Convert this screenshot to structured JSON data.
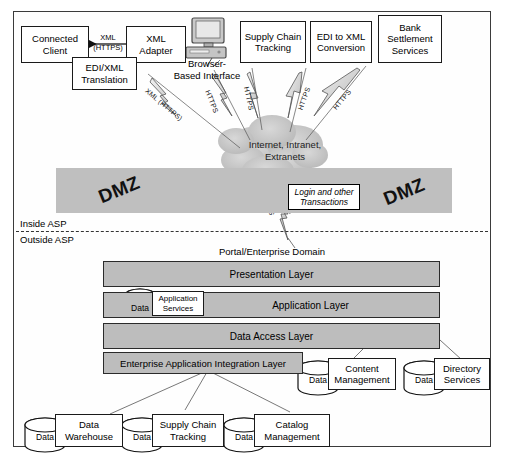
{
  "diagram": {
    "cloud": {
      "label": "Internet, Intranet,\nExtranets",
      "line1": "Internet, Intranet,",
      "line2": "Extranets"
    },
    "dmz": {
      "left_label": "DMZ",
      "right_label": "DMZ"
    },
    "boundary": {
      "inside_label": "Inside ASP",
      "outside_label": "Outside ASP"
    },
    "portal_title": "Portal/Enterprise Domain",
    "note_box": {
      "line1": "Login and other",
      "line2": "Transactions"
    },
    "browser": {
      "line1": "Browser-",
      "line2": "Based Interface",
      "icon": "desktop-computer-icon"
    }
  },
  "top_nodes": [
    {
      "id": "connected-client",
      "label": "Connected\nClient",
      "line1": "Connected",
      "line2": "Client"
    },
    {
      "id": "xml-adapter",
      "label": "XML\nAdapter",
      "line1": "XML",
      "line2": "Adapter"
    },
    {
      "id": "edi-xml-translation",
      "label": "EDI/XML\nTranslation",
      "line1": "EDI/XML",
      "line2": "Translation"
    },
    {
      "id": "supply-chain-tracking",
      "label": "Supply Chain\nTracking",
      "line1": "Supply Chain",
      "line2": "Tracking"
    },
    {
      "id": "edi-to-xml-conversion",
      "label": "EDI to XML\nConversion",
      "line1": "EDI to XML",
      "line2": "Conversion"
    },
    {
      "id": "bank-settlement-services",
      "label": "Bank\nSettlement\nServices",
      "line1": "Bank",
      "line2": "Settlement",
      "line3": "Services"
    }
  ],
  "connector_labels": {
    "client_to_adapter_line1": "XML",
    "client_to_adapter_line2": "(HTTPS)",
    "bolt_xml_https": "XML (HTTPS)",
    "bolt_https_1": "HTTPS",
    "bolt_https_2": "HTTPS",
    "bolt_https_3": "HTTPS",
    "bolt_https_4": "HTTPS",
    "bolt_https_dmz": "HTTPS"
  },
  "layers": [
    {
      "id": "presentation-layer",
      "label": "Presentation Layer"
    },
    {
      "id": "application-layer",
      "label": "Application Layer"
    },
    {
      "id": "data-access-layer",
      "label": "Data Access Layer"
    },
    {
      "id": "eai-layer",
      "label": "Enterprise Application Integration Layer"
    }
  ],
  "application_services": {
    "line1": "Application",
    "line2": "Services",
    "data_label": "Data"
  },
  "databases_right": [
    {
      "id": "content-management",
      "data_label": "Data",
      "line1": "Content",
      "line2": "Management"
    },
    {
      "id": "directory-services",
      "data_label": "Data",
      "line1": "Directory",
      "line2": "Services"
    }
  ],
  "databases_bottom": [
    {
      "id": "data-warehouse",
      "data_label": "Data",
      "line1": "Data",
      "line2": "Warehouse"
    },
    {
      "id": "supply-chain-tracking-db",
      "data_label": "Data",
      "line1": "Supply Chain",
      "line2": "Tracking"
    },
    {
      "id": "catalog-management",
      "data_label": "Data",
      "line1": "Catalog",
      "line2": "Management"
    }
  ],
  "colors": {
    "layer_fill": "#bdbdbd",
    "dmz_fill": "#bfbfbf",
    "stroke": "#1a1a1a",
    "background": "#ffffff"
  }
}
